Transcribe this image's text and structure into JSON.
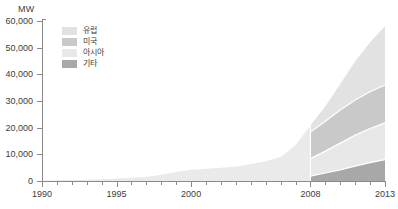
{
  "chart_data": {
    "type": "area",
    "title": "",
    "xlabel": "",
    "ylabel": "MW",
    "unit_label": "MW",
    "xlim": [
      1990,
      2013
    ],
    "ylim": [
      0,
      60000
    ],
    "grid": false,
    "legend_position": "top-left",
    "split_year": 2008,
    "x": [
      1990,
      1991,
      1992,
      1993,
      1994,
      1995,
      1996,
      1997,
      1998,
      1999,
      2000,
      2001,
      2002,
      2003,
      2004,
      2005,
      2006,
      2007,
      2008,
      2009,
      2010,
      2011,
      2012,
      2013
    ],
    "y_ticks": [
      0,
      10000,
      20000,
      30000,
      40000,
      50000,
      60000
    ],
    "y_tick_labels": [
      "0",
      "10,000",
      "20,000",
      "30,000",
      "40,000",
      "50,000",
      "60,000"
    ],
    "x_ticks": [
      1990,
      1991,
      1992,
      1993,
      1994,
      1995,
      1996,
      1997,
      1998,
      1999,
      2000,
      2001,
      2002,
      2003,
      2004,
      2005,
      2006,
      2007,
      2008,
      2009,
      2010,
      2011,
      2012,
      2013
    ],
    "x_tick_labels": [
      "1990",
      "1995",
      "2000",
      "2008",
      "2013"
    ],
    "x_labeled_ticks": [
      1990,
      1995,
      2000,
      2008,
      2013
    ],
    "historical": {
      "name": "전체",
      "color": "#eaeaea",
      "x": [
        1990,
        1991,
        1992,
        1993,
        1994,
        1995,
        1996,
        1997,
        1998,
        1999,
        2000,
        2001,
        2002,
        2003,
        2004,
        2005,
        2006,
        2007,
        2008
      ],
      "values": [
        150,
        250,
        380,
        500,
        700,
        900,
        1200,
        1500,
        2300,
        3400,
        4200,
        4600,
        5000,
        5300,
        6400,
        7400,
        9000,
        13500,
        20800
      ]
    },
    "series": [
      {
        "name": "유럽",
        "color": "#e2e2e2",
        "values_2008_2013": [
          2400,
          5600,
          9800,
          14500,
          18500,
          22000
        ]
      },
      {
        "name": "미국",
        "color": "#c9c9c9",
        "values_2008_2013": [
          10000,
          11200,
          12400,
          13200,
          13800,
          14200
        ]
      },
      {
        "name": "아시아",
        "color": "#e8e8e8",
        "values_2008_2013": [
          6600,
          8200,
          10000,
          11600,
          12800,
          13800
        ]
      },
      {
        "name": "기타",
        "color": "#a8a8a8",
        "values_2008_2013": [
          1800,
          3000,
          4200,
          5600,
          6900,
          8000
        ]
      }
    ],
    "cumulative_tops": {
      "note": "stacked cumulative upper boundary per series, 2008..2013",
      "기타": [
        1800,
        3000,
        4200,
        5600,
        6900,
        8000
      ],
      "아시아": [
        8400,
        11200,
        14200,
        17200,
        19700,
        21800
      ],
      "미국": [
        18400,
        22400,
        26600,
        30400,
        33500,
        36000
      ],
      "유럽": [
        20800,
        28000,
        36400,
        44900,
        52000,
        58000
      ]
    }
  },
  "legend": {
    "items": [
      {
        "label": "유럽",
        "color": "#e2e2e2"
      },
      {
        "label": "미국",
        "color": "#c9c9c9"
      },
      {
        "label": "아시아",
        "color": "#e8e8e8"
      },
      {
        "label": "기타",
        "color": "#a8a8a8"
      }
    ]
  },
  "axis": {
    "unit": "MW",
    "y_labels": [
      "60,000",
      "50,000",
      "40,000",
      "30,000",
      "20,000",
      "10,000",
      "0"
    ],
    "x_labels": [
      "1990",
      "1995",
      "2000",
      "2008",
      "2013"
    ]
  },
  "colors": {
    "axis": "#8a8a8a",
    "text": "#3d3d3d",
    "background": "#ffffff",
    "europe": "#e2e2e2",
    "usa": "#c9c9c9",
    "asia": "#e8e8e8",
    "other": "#a8a8a8",
    "historical": "#eaeaea"
  }
}
